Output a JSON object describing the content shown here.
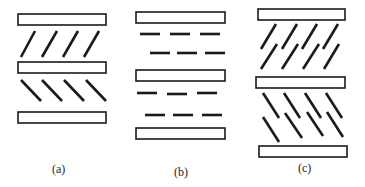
{
  "figure": {
    "panels": [
      {
        "id": "a",
        "label": "(a)",
        "plates": [
          {
            "x": 18,
            "y": 14,
            "w": 88,
            "h": 11
          },
          {
            "x": 18,
            "y": 62,
            "w": 88,
            "h": 11
          },
          {
            "x": 18,
            "y": 112,
            "w": 88,
            "h": 11
          }
        ],
        "rods": [
          {
            "x1": 21,
            "y1": 57,
            "x2": 35,
            "y2": 31
          },
          {
            "x1": 42,
            "y1": 57,
            "x2": 57,
            "y2": 31
          },
          {
            "x1": 63,
            "y1": 57,
            "x2": 78,
            "y2": 31
          },
          {
            "x1": 84,
            "y1": 57,
            "x2": 99,
            "y2": 31
          },
          {
            "x1": 21,
            "y1": 80,
            "x2": 41,
            "y2": 101
          },
          {
            "x1": 42,
            "y1": 80,
            "x2": 62,
            "y2": 101
          },
          {
            "x1": 64,
            "y1": 80,
            "x2": 84,
            "y2": 101
          },
          {
            "x1": 86,
            "y1": 80,
            "x2": 106,
            "y2": 101
          }
        ]
      },
      {
        "id": "b",
        "label": "(b)",
        "plates": [
          {
            "x": 136,
            "y": 12,
            "w": 89,
            "h": 11
          },
          {
            "x": 136,
            "y": 70,
            "w": 89,
            "h": 11
          },
          {
            "x": 136,
            "y": 128,
            "w": 89,
            "h": 11
          }
        ],
        "rods": [
          {
            "x1": 140,
            "y1": 34,
            "x2": 160,
            "y2": 34
          },
          {
            "x1": 170,
            "y1": 34,
            "x2": 190,
            "y2": 34
          },
          {
            "x1": 200,
            "y1": 34,
            "x2": 220,
            "y2": 34
          },
          {
            "x1": 150,
            "y1": 53,
            "x2": 170,
            "y2": 53
          },
          {
            "x1": 177,
            "y1": 53,
            "x2": 197,
            "y2": 53
          },
          {
            "x1": 205,
            "y1": 53,
            "x2": 225,
            "y2": 53
          },
          {
            "x1": 137,
            "y1": 93,
            "x2": 157,
            "y2": 93
          },
          {
            "x1": 167,
            "y1": 94,
            "x2": 187,
            "y2": 94
          },
          {
            "x1": 197,
            "y1": 93,
            "x2": 217,
            "y2": 93
          },
          {
            "x1": 145,
            "y1": 115,
            "x2": 165,
            "y2": 115
          },
          {
            "x1": 173,
            "y1": 115,
            "x2": 193,
            "y2": 115
          },
          {
            "x1": 202,
            "y1": 115,
            "x2": 222,
            "y2": 115
          }
        ]
      },
      {
        "id": "c",
        "label": "(c)",
        "plates": [
          {
            "x": 258,
            "y": 9,
            "w": 87,
            "h": 11
          },
          {
            "x": 256,
            "y": 77,
            "w": 89,
            "h": 11
          },
          {
            "x": 259,
            "y": 146,
            "w": 88,
            "h": 11
          }
        ],
        "rods": [
          {
            "x1": 261,
            "y1": 49,
            "x2": 276,
            "y2": 24
          },
          {
            "x1": 282,
            "y1": 49,
            "x2": 297,
            "y2": 24
          },
          {
            "x1": 302,
            "y1": 49,
            "x2": 317,
            "y2": 24
          },
          {
            "x1": 323,
            "y1": 49,
            "x2": 338,
            "y2": 24
          },
          {
            "x1": 261,
            "y1": 69,
            "x2": 277,
            "y2": 44
          },
          {
            "x1": 282,
            "y1": 69,
            "x2": 298,
            "y2": 44
          },
          {
            "x1": 303,
            "y1": 69,
            "x2": 319,
            "y2": 44
          },
          {
            "x1": 324,
            "y1": 69,
            "x2": 339,
            "y2": 44
          },
          {
            "x1": 263,
            "y1": 93,
            "x2": 279,
            "y2": 118
          },
          {
            "x1": 284,
            "y1": 93,
            "x2": 300,
            "y2": 118
          },
          {
            "x1": 305,
            "y1": 93,
            "x2": 321,
            "y2": 118
          },
          {
            "x1": 326,
            "y1": 93,
            "x2": 342,
            "y2": 118
          },
          {
            "x1": 263,
            "y1": 117,
            "x2": 279,
            "y2": 142
          },
          {
            "x1": 285,
            "y1": 113,
            "x2": 302,
            "y2": 138
          },
          {
            "x1": 307,
            "y1": 112,
            "x2": 323,
            "y2": 136
          },
          {
            "x1": 327,
            "y1": 112,
            "x2": 343,
            "y2": 137
          }
        ]
      }
    ],
    "labels": [
      {
        "text": "(a)",
        "x": 52,
        "y": 162
      },
      {
        "text": "(b)",
        "x": 174,
        "y": 165
      },
      {
        "text": "(c)",
        "x": 298,
        "y": 161
      }
    ]
  }
}
